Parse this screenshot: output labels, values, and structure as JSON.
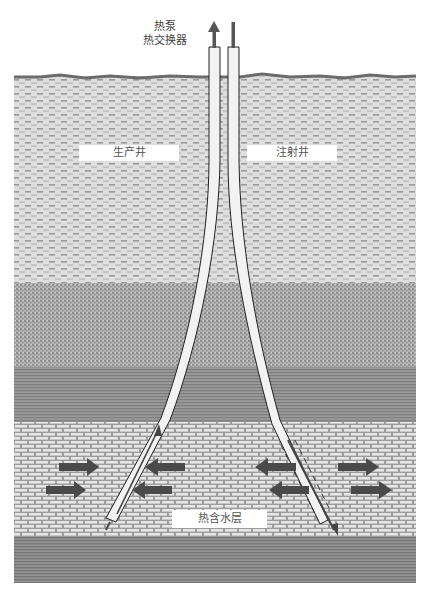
{
  "title_labels": {
    "heat_pump": "热泵",
    "heat_exchanger": "热交换器"
  },
  "wells": {
    "production_well": "生产井",
    "injection_well": "注射井"
  },
  "aquifer_label": "热含水层",
  "colors": {
    "surface_line": "#6e6e6e",
    "dashed_layer_bg": "#d9d9d9",
    "speckled_layer_bg": "#a8a8a8",
    "striped_layer_bg": "#8c8c8c",
    "brick_layer_bg": "#b8b8b8",
    "bottom_layer_bg": "#888888",
    "pipe_fill": "#f2f2f2",
    "pipe_stroke": "#222222",
    "arrow_fill": "#4a4a4a"
  },
  "layers": [
    {
      "name": "topsoil-dashed",
      "top": 76,
      "bottom": 283
    },
    {
      "name": "speckled-sediment",
      "top": 283,
      "bottom": 367
    },
    {
      "name": "clay-striped",
      "top": 367,
      "bottom": 422
    },
    {
      "name": "aquifer-brick",
      "top": 422,
      "bottom": 537
    },
    {
      "name": "bedrock-striped",
      "top": 537,
      "bottom": 583
    }
  ]
}
